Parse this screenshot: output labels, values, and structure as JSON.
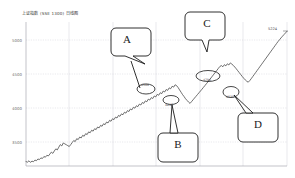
{
  "header": {
    "title": "上证指数 (SSE 1300) 日线图"
  },
  "chart_data": {
    "type": "line",
    "title": "上证指数 (SSE 1300) 日线图",
    "xlabel": "",
    "ylabel": "",
    "ylim": [
      3400,
      5350
    ],
    "yticks": [
      5000,
      4500,
      4000,
      3500
    ],
    "ytick_labels": [
      "5000",
      "4500",
      "4000",
      "3500"
    ],
    "xlim": [
      0,
      100
    ],
    "xticks": [
      0,
      16.7,
      33.3,
      50,
      66.7,
      83.3,
      100
    ],
    "xtick_labels": [
      "",
      "",
      "",
      "",
      "",
      "",
      ""
    ],
    "grid": true,
    "legend": null,
    "line_color": "#404040",
    "series": [
      {
        "name": "收盘价",
        "values": [
          3460,
          3452,
          3471,
          3449,
          3466,
          3458,
          3480,
          3472,
          3495,
          3487,
          3510,
          3502,
          3528,
          3519,
          3545,
          3536,
          3562,
          3588,
          3571,
          3604,
          3632,
          3618,
          3655,
          3690,
          3672,
          3712,
          3700,
          3688,
          3676,
          3664,
          3690,
          3718,
          3745,
          3731,
          3770,
          3758,
          3792,
          3780,
          3815,
          3803,
          3838,
          3826,
          3862,
          3850,
          3884,
          3872,
          3905,
          3893,
          3928,
          3916,
          3950,
          3938,
          3972,
          3960,
          3995,
          3983,
          4018,
          4006,
          4040,
          4028,
          4062,
          4050,
          4085,
          4073,
          4106,
          4094,
          4128,
          4116,
          4150,
          4138,
          4172,
          4160,
          4195,
          4183,
          4216,
          4204,
          4238,
          4226,
          4260,
          4248,
          4282,
          4270,
          4305,
          4293,
          4326,
          4314,
          4348,
          4336,
          4370,
          4358,
          4392,
          4380,
          4415,
          4403,
          4436,
          4424,
          4458,
          4446,
          4480,
          4468,
          4500,
          4488,
          4462,
          4430,
          4398,
          4366,
          4340,
          4310,
          4288,
          4265,
          4248,
          4272,
          4296,
          4320,
          4344,
          4368,
          4392,
          4416,
          4440,
          4465,
          4490,
          4515,
          4540,
          4566,
          4592,
          4618,
          4644,
          4670,
          4696,
          4722,
          4748,
          4760,
          4744,
          4772,
          4756,
          4784,
          4768,
          4796,
          4780,
          4762,
          4740,
          4716,
          4690,
          4664,
          4638,
          4612,
          4588,
          4566,
          4548,
          4535,
          4556,
          4582,
          4610,
          4638,
          4666,
          4694,
          4722,
          4750,
          4778,
          4806,
          4834,
          4862,
          4890,
          4918,
          4946,
          4974,
          5002,
          5030,
          5058,
          5086,
          5110,
          5135,
          5158,
          5180,
          5202,
          5224
        ]
      }
    ],
    "annotations": [
      {
        "id": "A",
        "label": "A",
        "point_label": "4500",
        "marker": "ellipse",
        "description": "第一个回调高点"
      },
      {
        "id": "B",
        "label": "B",
        "point_label": "4248",
        "marker": "ellipse",
        "description": "回调低点"
      },
      {
        "id": "C",
        "label": "C",
        "point_label": "4796",
        "marker": "ellipse",
        "description": "第二个高点区"
      },
      {
        "id": "D",
        "label": "D",
        "point_label": "4535",
        "marker": "ellipse",
        "description": "二次回调低点"
      }
    ],
    "end_label": "5224"
  },
  "colors": {
    "line": "#404040",
    "grid": "#c8c8d2",
    "axis": "#9a9aa6",
    "callout_border": "#1a1a1a",
    "text": "#3a3a3a"
  }
}
